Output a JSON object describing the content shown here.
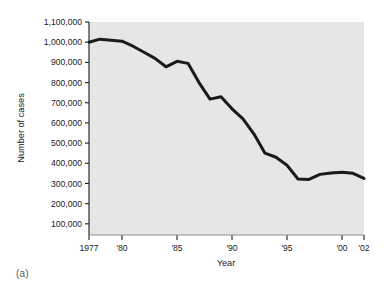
{
  "figure": {
    "caption": "(a)"
  },
  "chart_data": {
    "type": "line",
    "title": "",
    "xlabel": "Year",
    "ylabel": "Number of cases",
    "xlim": [
      1977,
      2002
    ],
    "ylim": [
      0,
      1100000
    ],
    "grid": false,
    "legend": null,
    "plot_background": "#e6e6e6",
    "line_color": "#1a1a1a",
    "line_width": 3,
    "x_tick_values": [
      1977,
      1980,
      1985,
      1990,
      1995,
      2000,
      2002
    ],
    "x_tick_labels": [
      "1977",
      "'80",
      "'85",
      "'90",
      "'95",
      "'00",
      "'02"
    ],
    "y_tick_values": [
      100000,
      200000,
      300000,
      400000,
      500000,
      600000,
      700000,
      800000,
      900000,
      1000000,
      1100000
    ],
    "y_tick_labels": [
      "100,000",
      "200,000",
      "300,000",
      "400,000",
      "500,000",
      "600,000",
      "700,000",
      "800,000",
      "900,000",
      "1,000,000",
      "1,100,000"
    ],
    "x": [
      1977,
      1978,
      1979,
      1980,
      1981,
      1982,
      1983,
      1984,
      1985,
      1986,
      1987,
      1988,
      1989,
      1990,
      1991,
      1992,
      1993,
      1994,
      1995,
      1996,
      1997,
      1998,
      1999,
      2000,
      2001,
      2002
    ],
    "values": [
      1000000,
      1015000,
      1010000,
      1005000,
      980000,
      950000,
      920000,
      878000,
      905000,
      895000,
      800000,
      718000,
      730000,
      670000,
      620000,
      545000,
      450000,
      430000,
      390000,
      322000,
      320000,
      345000,
      352000,
      355000,
      350000,
      325000
    ],
    "series": [
      {
        "name": "Number of cases",
        "values": [
          1000000,
          1015000,
          1010000,
          1005000,
          980000,
          950000,
          920000,
          878000,
          905000,
          895000,
          800000,
          718000,
          730000,
          670000,
          620000,
          545000,
          450000,
          430000,
          390000,
          322000,
          320000,
          345000,
          352000,
          355000,
          350000,
          325000
        ]
      }
    ]
  }
}
